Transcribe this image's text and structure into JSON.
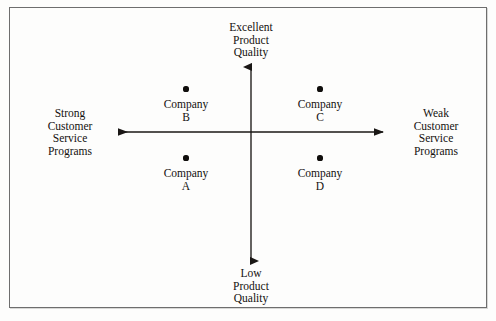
{
  "diagram": {
    "type": "perceptual-positioning-map",
    "axes": {
      "vertical": {
        "top_label": "Excellent\nProduct\nQuality",
        "bottom_label": "Low\nProduct\nQuality",
        "x": 251,
        "y_top": 66,
        "y_bottom": 262
      },
      "horizontal": {
        "left_label": "Strong\nCustomer\nService\nPrograms",
        "right_label": "Weak\nCustomer\nService\nPrograms",
        "y": 132,
        "x_left": 118,
        "x_right": 384
      }
    },
    "points": [
      {
        "label": "Company\nB",
        "name": "Company B",
        "quadrant": "upper-left",
        "x": 186,
        "y": 89
      },
      {
        "label": "Company\nC",
        "name": "Company C",
        "quadrant": "upper-right",
        "x": 320,
        "y": 89
      },
      {
        "label": "Company\nA",
        "name": "Company A",
        "quadrant": "lower-left",
        "x": 186,
        "y": 158
      },
      {
        "label": "Company\nD",
        "name": "Company D",
        "quadrant": "lower-right",
        "x": 320,
        "y": 158
      }
    ],
    "colors": {
      "ink": "#14110f",
      "axis": "#1a1715",
      "frame": "#6e6e6e",
      "background": "#fdfdfc"
    }
  }
}
